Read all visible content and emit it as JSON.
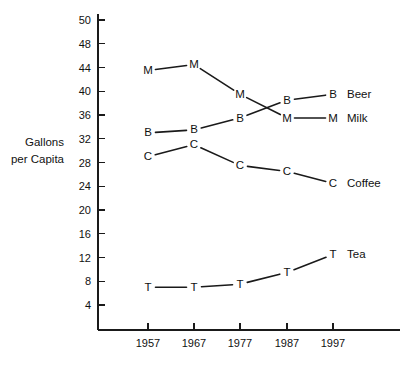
{
  "chart_data": {
    "type": "line",
    "title": "",
    "xlabel": "",
    "ylabel": "Gallons per Capita",
    "ylabel_line1": "Gallons",
    "ylabel_line2": "per Capita",
    "x": [
      1957,
      1967,
      1977,
      1987,
      1997
    ],
    "categories": [
      "1957",
      "1967",
      "1977",
      "1987",
      "1997"
    ],
    "xtick_labels": [
      "1957",
      "1967",
      "1977",
      "1987",
      "1997"
    ],
    "ytick_labels": [
      "50",
      "48",
      "44",
      "40",
      "36",
      "32",
      "28",
      "24",
      "20",
      "16",
      "12",
      "8",
      "4"
    ],
    "ytick_values": [
      52,
      48,
      44,
      40,
      36,
      32,
      28,
      24,
      20,
      16,
      12,
      8,
      4
    ],
    "ylim": [
      2,
      52
    ],
    "xlim": [
      1952,
      2002
    ],
    "grid": false,
    "legend_position": "right-of-line-ends",
    "series": [
      {
        "name": "Beer",
        "label": "Beer",
        "marker": "B",
        "values": [
          33,
          33.5,
          35.5,
          38.5,
          39.5
        ]
      },
      {
        "name": "Milk",
        "label": "Milk",
        "marker": "M",
        "values": [
          43.5,
          44.5,
          39.5,
          35.5,
          35.5
        ]
      },
      {
        "name": "Coffee",
        "label": "Coffee",
        "marker": "C",
        "values": [
          29,
          31,
          27.5,
          26.5,
          24.5
        ]
      },
      {
        "name": "Tea",
        "label": "Tea",
        "marker": "T",
        "values": [
          7,
          7,
          7.5,
          9.5,
          12.5
        ]
      }
    ],
    "colors": {
      "line": "#1a1a1a",
      "text": "#111111",
      "axis": "#1a1a1a",
      "background": "#ffffff"
    }
  }
}
